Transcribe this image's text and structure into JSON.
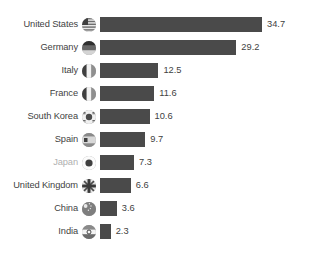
{
  "chart_data": {
    "type": "bar",
    "orientation": "horizontal",
    "title": "",
    "subtitle": "",
    "xlabel": "",
    "ylabel": "",
    "grid": false,
    "legend": null,
    "axis_visible": false,
    "value_labels_shown": true,
    "xlim": [
      0,
      34.7
    ],
    "categories": [
      "United States",
      "Germany",
      "Italy",
      "France",
      "South Korea",
      "Spain",
      "Japan",
      "United Kingdom",
      "China",
      "India"
    ],
    "values": [
      34.7,
      29.2,
      12.5,
      11.6,
      10.6,
      9.7,
      7.3,
      6.6,
      3.6,
      2.3
    ],
    "value_labels": [
      "34.7",
      "29.2",
      "12.5",
      "11.6",
      "10.6",
      "9.7",
      "7.3",
      "6.6",
      "3.6",
      "2.3"
    ],
    "icons": [
      "flag-united-states-icon",
      "flag-germany-icon",
      "flag-italy-icon",
      "flag-france-icon",
      "flag-south-korea-icon",
      "flag-spain-icon",
      "flag-japan-icon",
      "flag-united-kingdom-icon",
      "flag-china-icon",
      "flag-india-icon"
    ],
    "highlighted_category": "Japan",
    "colors": {
      "bar": "#4a4a4a",
      "label": "#3f3f3f",
      "label_dimmed": "#b0b0b0",
      "background": "#ffffff"
    }
  }
}
